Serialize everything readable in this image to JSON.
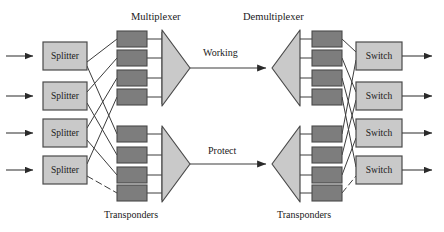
{
  "figure": {
    "type": "network-diagram",
    "background": "#ffffff"
  },
  "colors": {
    "line": "#3c3c3c",
    "light_box_fill": "#c9c9c9",
    "light_box_stroke": "#4a4a4a",
    "dark_box_fill": "#7d7d7d",
    "dark_box_stroke": "#4a4a4a",
    "mux_fill": "#c9c9c9",
    "mux_stroke": "#4a4a4a",
    "text": "#1a1a1a"
  },
  "labels": {
    "multiplexer": "Multiplexer",
    "demultiplexer": "Demultiplexer",
    "working": "Working",
    "protect": "Protect",
    "transponders_left": "Transponders",
    "transponders_right": "Transponders"
  },
  "splitters": [
    {
      "label": "Splitter"
    },
    {
      "label": "Splitter"
    },
    {
      "label": "Splitter"
    },
    {
      "label": "Splitter"
    }
  ],
  "switches": [
    {
      "label": "Switch"
    },
    {
      "label": "Switch"
    },
    {
      "label": "Switch"
    },
    {
      "label": "Switch"
    }
  ],
  "transponders_left_working": [
    {
      "label": ""
    },
    {
      "label": ""
    },
    {
      "label": ""
    },
    {
      "label": ""
    }
  ],
  "transponders_left_protect": [
    {
      "label": ""
    },
    {
      "label": ""
    },
    {
      "label": ""
    },
    {
      "label": ""
    }
  ],
  "transponders_right_working": [
    {
      "label": ""
    },
    {
      "label": ""
    },
    {
      "label": ""
    },
    {
      "label": ""
    }
  ],
  "transponders_right_protect": [
    {
      "label": ""
    },
    {
      "label": ""
    },
    {
      "label": ""
    },
    {
      "label": ""
    }
  ],
  "trunks": [
    {
      "name": "Working",
      "label": "Working"
    },
    {
      "name": "Protect",
      "label": "Protect"
    }
  ],
  "inputs": [
    {
      "name": "input-1"
    },
    {
      "name": "input-2"
    },
    {
      "name": "input-3"
    },
    {
      "name": "input-4"
    }
  ],
  "outputs": [
    {
      "name": "output-1"
    },
    {
      "name": "output-2"
    },
    {
      "name": "output-3"
    },
    {
      "name": "output-4"
    }
  ]
}
